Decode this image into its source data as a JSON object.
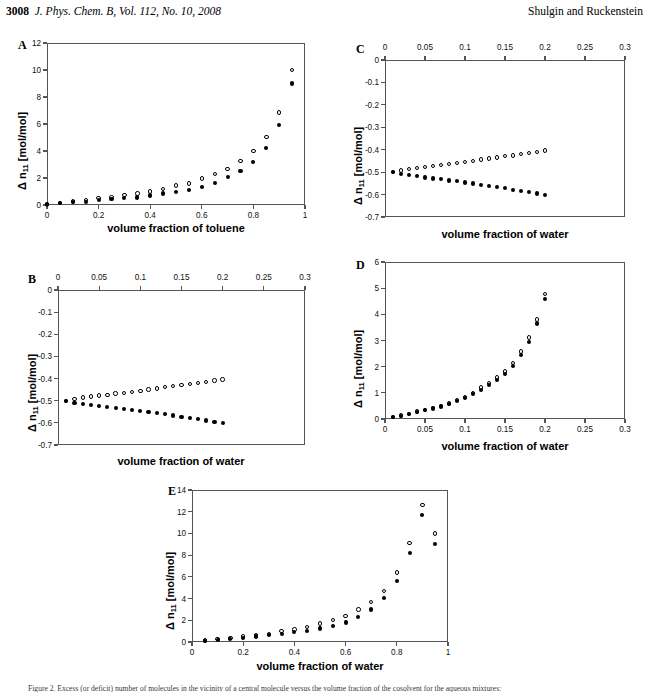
{
  "header": {
    "folio": "3008",
    "journal_ref": "J. Phys. Chem. B, Vol. 112, No. 10, 2008",
    "authors": "Shulgin and Ruckenstein"
  },
  "caption": {
    "text": "Figure 2. Excess (or deficit) number of molecules in the vicinity of a central molecule versus the volume fraction of the cosolvent for the aqueous mixtures:"
  },
  "axis_titles": {
    "y_delta": "Δ n",
    "y_sub": "11",
    "y_units": " [mol/mol]",
    "x_toluene": "volume fraction of toluene",
    "x_water": "volume fraction of water"
  },
  "chart_data": [
    {
      "id": "A",
      "type": "scatter",
      "panel_letter": "A",
      "title": "",
      "xlabel": "volume fraction of toluene",
      "ylabel": "Δ n11 [mol/mol]",
      "xlim": [
        0,
        1
      ],
      "ylim": [
        0,
        12
      ],
      "xticks": [
        0,
        0.2,
        0.4,
        0.6,
        0.8,
        1
      ],
      "xtick_labels": [
        "0",
        "0.2",
        "0.4",
        "0.6",
        "0.8",
        "1"
      ],
      "yticks": [
        0,
        2,
        4,
        6,
        8,
        10,
        12
      ],
      "ytick_labels": [
        "0",
        "2",
        "4",
        "6",
        "8",
        "10",
        "12"
      ],
      "x_axis_position": "bottom",
      "grid": false,
      "legend": "none",
      "x": [
        0.0,
        0.05,
        0.1,
        0.15,
        0.2,
        0.25,
        0.3,
        0.35,
        0.4,
        0.45,
        0.5,
        0.55,
        0.6,
        0.65,
        0.7,
        0.75,
        0.8,
        0.85,
        0.9,
        0.95
      ],
      "series": [
        {
          "name": "open-circles",
          "marker": "open",
          "values": [
            0.05,
            0.15,
            0.25,
            0.35,
            0.5,
            0.55,
            0.75,
            0.85,
            1.0,
            1.2,
            1.45,
            1.6,
            1.95,
            2.3,
            2.65,
            3.25,
            4.0,
            5.05,
            6.85,
            10.0
          ]
        },
        {
          "name": "filled-circles",
          "marker": "filled",
          "values": [
            0.05,
            0.12,
            0.2,
            0.25,
            0.4,
            0.45,
            0.5,
            0.55,
            0.7,
            0.85,
            0.95,
            1.1,
            1.35,
            1.65,
            2.05,
            2.5,
            3.2,
            4.25,
            5.95,
            9.0
          ]
        }
      ]
    },
    {
      "id": "C",
      "type": "scatter",
      "panel_letter": "C",
      "title": "",
      "xlabel": "volume fraction of water",
      "ylabel": "Δ n11 [mol/mol]",
      "xlim": [
        0,
        0.3
      ],
      "ylim": [
        -0.7,
        0
      ],
      "xticks": [
        0,
        0.05,
        0.1,
        0.15,
        0.2,
        0.25,
        0.3
      ],
      "xtick_labels": [
        "0",
        "0.05",
        "0.1",
        "0.15",
        "0.2",
        "0.25",
        "0.3"
      ],
      "yticks": [
        0,
        -0.1,
        -0.2,
        -0.3,
        -0.4,
        -0.5,
        -0.6,
        -0.7
      ],
      "ytick_labels": [
        "0",
        "-0.1",
        "-0.2",
        "-0.3",
        "-0.4",
        "-0.5",
        "-0.6",
        "-0.7"
      ],
      "x_axis_position": "top",
      "grid": false,
      "legend": "none",
      "x": [
        0.01,
        0.02,
        0.03,
        0.04,
        0.05,
        0.06,
        0.07,
        0.08,
        0.09,
        0.1,
        0.11,
        0.12,
        0.13,
        0.14,
        0.15,
        0.16,
        0.17,
        0.18,
        0.19,
        0.2
      ],
      "series": [
        {
          "name": "open-circles",
          "marker": "open",
          "values": [
            -0.5,
            -0.492,
            -0.486,
            -0.481,
            -0.477,
            -0.473,
            -0.468,
            -0.464,
            -0.46,
            -0.455,
            -0.449,
            -0.444,
            -0.439,
            -0.434,
            -0.429,
            -0.425,
            -0.42,
            -0.415,
            -0.409,
            -0.404
          ]
        },
        {
          "name": "filled-circles",
          "marker": "filled",
          "values": [
            -0.501,
            -0.509,
            -0.514,
            -0.519,
            -0.524,
            -0.528,
            -0.532,
            -0.537,
            -0.541,
            -0.546,
            -0.551,
            -0.556,
            -0.561,
            -0.567,
            -0.572,
            -0.578,
            -0.583,
            -0.589,
            -0.595,
            -0.602
          ]
        }
      ]
    },
    {
      "id": "B",
      "type": "scatter",
      "panel_letter": "B",
      "title": "",
      "xlabel": "volume fraction of water",
      "ylabel": "Δ n11 [mol/mol]",
      "xlim": [
        0,
        0.3
      ],
      "ylim": [
        -0.7,
        0
      ],
      "xticks": [
        0,
        0.05,
        0.1,
        0.15,
        0.2,
        0.25,
        0.3
      ],
      "xtick_labels": [
        "0",
        "0.05",
        "0.1",
        "0.15",
        "0.2",
        "0.25",
        "0.3"
      ],
      "yticks": [
        0,
        -0.1,
        -0.2,
        -0.3,
        -0.4,
        -0.5,
        -0.6,
        -0.7
      ],
      "ytick_labels": [
        "0",
        "-0.1",
        "-0.2",
        "-0.3",
        "-0.4",
        "-0.5",
        "-0.6",
        "-0.7"
      ],
      "x_axis_position": "top",
      "grid": false,
      "legend": "none",
      "x": [
        0.01,
        0.02,
        0.03,
        0.04,
        0.05,
        0.06,
        0.07,
        0.08,
        0.09,
        0.1,
        0.11,
        0.12,
        0.13,
        0.14,
        0.15,
        0.16,
        0.17,
        0.18,
        0.19,
        0.2
      ],
      "series": [
        {
          "name": "open-circles",
          "marker": "open",
          "values": [
            -0.5,
            -0.492,
            -0.486,
            -0.481,
            -0.477,
            -0.473,
            -0.468,
            -0.464,
            -0.46,
            -0.455,
            -0.449,
            -0.444,
            -0.439,
            -0.434,
            -0.429,
            -0.425,
            -0.42,
            -0.415,
            -0.409,
            -0.404
          ]
        },
        {
          "name": "filled-circles",
          "marker": "filled",
          "values": [
            -0.501,
            -0.509,
            -0.514,
            -0.519,
            -0.524,
            -0.528,
            -0.532,
            -0.537,
            -0.541,
            -0.546,
            -0.551,
            -0.556,
            -0.561,
            -0.567,
            -0.572,
            -0.578,
            -0.583,
            -0.589,
            -0.595,
            -0.602
          ]
        }
      ]
    },
    {
      "id": "D",
      "type": "scatter",
      "panel_letter": "D",
      "title": "",
      "xlabel": "volume fraction of water",
      "ylabel": "Δ n11 [mol/mol]",
      "xlim": [
        0,
        0.3
      ],
      "ylim": [
        0,
        6
      ],
      "xticks": [
        0,
        0.05,
        0.1,
        0.15,
        0.2,
        0.25,
        0.3
      ],
      "xtick_labels": [
        "0",
        "0.05",
        "0.1",
        "0.15",
        "0.2",
        "0.25",
        "0.3"
      ],
      "yticks": [
        0,
        1,
        2,
        3,
        4,
        5,
        6
      ],
      "ytick_labels": [
        "0",
        "1",
        "2",
        "3",
        "4",
        "5",
        "6"
      ],
      "x_axis_position": "bottom",
      "grid": false,
      "legend": "none",
      "x": [
        0.01,
        0.02,
        0.03,
        0.04,
        0.05,
        0.06,
        0.07,
        0.08,
        0.09,
        0.1,
        0.11,
        0.12,
        0.13,
        0.14,
        0.15,
        0.16,
        0.17,
        0.18,
        0.19,
        0.2
      ],
      "series": [
        {
          "name": "open-circles",
          "marker": "open",
          "values": [
            0.08,
            0.13,
            0.2,
            0.28,
            0.35,
            0.42,
            0.5,
            0.6,
            0.72,
            0.85,
            1.0,
            1.2,
            1.38,
            1.58,
            1.82,
            2.15,
            2.58,
            3.12,
            3.8,
            4.78
          ]
        },
        {
          "name": "filled-circles",
          "marker": "filled",
          "values": [
            0.07,
            0.12,
            0.18,
            0.26,
            0.33,
            0.4,
            0.48,
            0.57,
            0.68,
            0.8,
            0.95,
            1.12,
            1.3,
            1.5,
            1.72,
            2.03,
            2.45,
            2.95,
            3.65,
            4.6
          ]
        }
      ]
    },
    {
      "id": "E",
      "type": "scatter",
      "panel_letter": "E",
      "title": "",
      "xlabel": "volume fraction of water",
      "ylabel": "Δ n11 [mol/mol]",
      "xlim": [
        0,
        1
      ],
      "ylim": [
        0,
        14
      ],
      "xticks": [
        0,
        0.2,
        0.4,
        0.6,
        0.8,
        1
      ],
      "xtick_labels": [
        "0",
        "0.2",
        "0.4",
        "0.6",
        "0.8",
        "1"
      ],
      "yticks": [
        0,
        2,
        4,
        6,
        8,
        10,
        12,
        14
      ],
      "ytick_labels": [
        "0",
        "2",
        "4",
        "6",
        "8",
        "10",
        "12",
        "14"
      ],
      "x_axis_position": "bottom",
      "grid": false,
      "legend": "none",
      "x": [
        0.05,
        0.1,
        0.15,
        0.2,
        0.25,
        0.3,
        0.35,
        0.4,
        0.45,
        0.5,
        0.55,
        0.6,
        0.65,
        0.7,
        0.75,
        0.8,
        0.85,
        0.9,
        0.95
      ],
      "series": [
        {
          "name": "open-circles",
          "marker": "open",
          "values": [
            0.15,
            0.25,
            0.35,
            0.5,
            0.6,
            0.75,
            1.0,
            1.15,
            1.4,
            1.7,
            2.0,
            2.4,
            3.0,
            3.7,
            4.7,
            6.4,
            9.1,
            12.6,
            10.0
          ]
        },
        {
          "name": "filled-circles",
          "marker": "filled",
          "values": [
            0.12,
            0.2,
            0.28,
            0.4,
            0.5,
            0.62,
            0.75,
            0.9,
            1.05,
            1.25,
            1.5,
            1.8,
            2.3,
            3.0,
            4.05,
            5.6,
            8.2,
            11.7,
            9.0
          ]
        }
      ]
    }
  ]
}
